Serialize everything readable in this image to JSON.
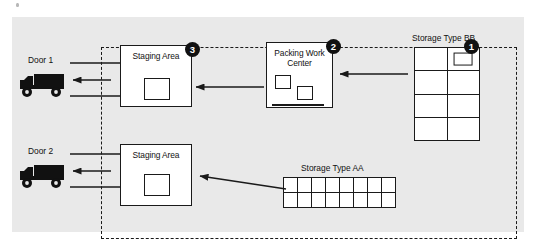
{
  "diagram": {
    "canvas": {
      "background_color": "#e9e9e9"
    },
    "boundary": {
      "name": "warehouse-boundary",
      "style": "dashed",
      "color": "#1a1a1a"
    },
    "doors": [
      {
        "id": "door-1",
        "label": "Door 1",
        "vehicle_icon": "delivery-truck-icon"
      },
      {
        "id": "door-2",
        "label": "Door 2",
        "vehicle_icon": "delivery-truck-icon"
      }
    ],
    "areas": [
      {
        "id": "staging-area-top",
        "label": "Staging Area"
      },
      {
        "id": "staging-area-bottom",
        "label": "Staging Area"
      },
      {
        "id": "packing-work-center",
        "label": "Packing Work\nCenter",
        "label_line_1": "Packing Work",
        "label_line_2": "Center"
      }
    ],
    "storage": [
      {
        "id": "storage-bb",
        "label": "Storage Type BB",
        "columns": 2,
        "rows": 4,
        "pallet_cells": [
          1
        ]
      },
      {
        "id": "storage-aa",
        "label": "Storage Type AA",
        "columns": 8,
        "rows": 2,
        "pallet_cells": []
      }
    ],
    "steps": [
      {
        "id": "step-badge-1",
        "number": "1",
        "at": "storage-bb"
      },
      {
        "id": "step-badge-2",
        "number": "2",
        "at": "packing-work-center"
      },
      {
        "id": "step-badge-3",
        "number": "3",
        "at": "staging-area-top"
      }
    ],
    "flows": [
      {
        "id": "flow-bb-to-packing",
        "from": "storage-bb",
        "to": "packing-work-center",
        "direction": "left"
      },
      {
        "id": "flow-packing-to-staging-top",
        "from": "packing-work-center",
        "to": "staging-area-top",
        "direction": "left"
      },
      {
        "id": "flow-staging-top-to-door-1",
        "from": "staging-area-top",
        "to": "door-1",
        "direction": "left"
      },
      {
        "id": "flow-aa-to-staging-bottom",
        "from": "storage-aa",
        "to": "staging-area-bottom",
        "direction": "up-left"
      },
      {
        "id": "flow-staging-bottom-to-door-2",
        "from": "staging-area-bottom",
        "to": "door-2",
        "direction": "left"
      }
    ],
    "colors": {
      "ink": "#1a1a1a",
      "panel": "#e9e9e9",
      "box_fill": "#ffffff",
      "badge": "#111111",
      "badge_text": "#ffffff"
    }
  }
}
